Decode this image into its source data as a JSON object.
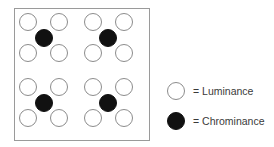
{
  "figure": {
    "name": "sampling-pattern-diagram",
    "background_color": "#ffffff"
  },
  "sample_grid": {
    "border_color": "#9a9a9a",
    "border_width": 1,
    "bounds": {
      "x": 14,
      "y": 8,
      "width": 136,
      "height": 133
    },
    "luminance": {
      "label": "Luminance",
      "fill_color": "#ffffff",
      "stroke_color": "#8c8c8c",
      "radius": 8.5,
      "columns": [
        28,
        59,
        93,
        124
      ],
      "rows": [
        22,
        53,
        87,
        118
      ],
      "points": [
        {
          "x": 28,
          "y": 22
        },
        {
          "x": 59,
          "y": 22
        },
        {
          "x": 93,
          "y": 22
        },
        {
          "x": 124,
          "y": 22
        },
        {
          "x": 28,
          "y": 53
        },
        {
          "x": 59,
          "y": 53
        },
        {
          "x": 93,
          "y": 53
        },
        {
          "x": 124,
          "y": 53
        },
        {
          "x": 28,
          "y": 87
        },
        {
          "x": 59,
          "y": 87
        },
        {
          "x": 93,
          "y": 87
        },
        {
          "x": 124,
          "y": 87
        },
        {
          "x": 28,
          "y": 118
        },
        {
          "x": 59,
          "y": 118
        },
        {
          "x": 93,
          "y": 118
        },
        {
          "x": 124,
          "y": 118
        }
      ],
      "count": 16
    },
    "chrominance": {
      "label": "Chrominance",
      "fill_color": "#111111",
      "stroke_color": "#111111",
      "radius": 8.5,
      "points": [
        {
          "x": 44,
          "y": 38
        },
        {
          "x": 108,
          "y": 38
        },
        {
          "x": 44,
          "y": 103
        },
        {
          "x": 108,
          "y": 103
        }
      ],
      "count": 4
    }
  },
  "legend": {
    "items": [
      {
        "key": "luminance",
        "marker": "open-circle",
        "text": "= Luminance",
        "fill_color": "#ffffff",
        "stroke_color": "#8c8c8c",
        "marker_x": 176,
        "marker_y": 91,
        "text_x": 193,
        "text_y": 95
      },
      {
        "key": "chrominance",
        "marker": "filled-circle",
        "text": "= Chrominance",
        "fill_color": "#111111",
        "stroke_color": "#111111",
        "marker_x": 176,
        "marker_y": 121,
        "text_x": 193,
        "text_y": 125
      }
    ],
    "text_color": "#3a3a3a",
    "font_size": 10.5
  }
}
